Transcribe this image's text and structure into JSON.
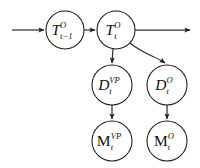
{
  "figure": {
    "background_color": "#ffffff",
    "stroke_color": "#333333",
    "node_stroke_color": "#1a1a1a",
    "label_color": "#111111"
  },
  "nodes": [
    {
      "id": "T_prev",
      "name": "node-t-prev",
      "base": "T",
      "superscript": "O",
      "subscript": "t−1",
      "base_style": "italic",
      "cx": 65,
      "cy": 30,
      "r": 19
    },
    {
      "id": "T_cur",
      "name": "node-t-current",
      "base": "T",
      "superscript": "O",
      "subscript": "t",
      "base_style": "italic",
      "cx": 116,
      "cy": 30,
      "r": 19
    },
    {
      "id": "D_vp",
      "name": "node-d-vp",
      "base": "D",
      "superscript": "VP",
      "subscript": "t",
      "base_style": "italic",
      "cx": 112,
      "cy": 85,
      "r": 20
    },
    {
      "id": "D_o",
      "name": "node-d-o",
      "base": "D",
      "superscript": "O",
      "subscript": "t",
      "base_style": "italic",
      "cx": 167,
      "cy": 85,
      "r": 20
    },
    {
      "id": "M_vp",
      "name": "node-m-vp",
      "base": "M",
      "superscript": "VP",
      "subscript": "t",
      "base_style": "roman",
      "cx": 112,
      "cy": 141,
      "r": 20
    },
    {
      "id": "M_o",
      "name": "node-m-o",
      "base": "M",
      "superscript": "O",
      "subscript": "t",
      "base_style": "roman",
      "cx": 167,
      "cy": 141,
      "r": 20
    }
  ],
  "edges": [
    {
      "id": "e_in",
      "name": "edge-incoming-to-t-prev",
      "kind": "straight",
      "path": "M 12,30 L 44,30"
    },
    {
      "id": "e_tprev_tcur",
      "name": "edge-t-prev-to-t-current",
      "kind": "straight",
      "path": "M 84,30 L 95,30"
    },
    {
      "id": "e_out",
      "name": "edge-t-current-outgoing",
      "kind": "straight",
      "path": "M 135,30 L 190,30"
    },
    {
      "id": "e_tcur_dvp",
      "name": "edge-t-current-to-d-vp",
      "kind": "straight",
      "path": "M 113,49 L 112,63"
    },
    {
      "id": "e_tcur_do",
      "name": "edge-t-current-to-d-o",
      "kind": "curve",
      "path": "M 130,43 C 145,55 155,56 165,63"
    },
    {
      "id": "e_dvp_mvp",
      "name": "edge-d-vp-to-m-vp",
      "kind": "straight",
      "path": "M 112,105 L 112,119"
    },
    {
      "id": "e_do_mo",
      "name": "edge-d-o-to-m-o",
      "kind": "straight",
      "path": "M 167,105 L 167,119"
    }
  ]
}
